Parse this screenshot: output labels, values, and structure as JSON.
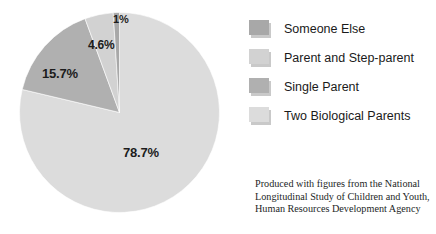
{
  "chart_data": {
    "type": "pie",
    "title": "",
    "labels": [
      "Two Biological Parents",
      "Single Parent",
      "Parent and Step-parent",
      "Someone Else"
    ],
    "values": [
      78.7,
      15.7,
      4.6,
      1
    ],
    "value_labels": [
      "78.7%",
      "15.7%",
      "4.6%",
      "1%"
    ],
    "colors": [
      "#dcdcdc",
      "#b0b0b0",
      "#d2d2d2",
      "#a8a8a8"
    ],
    "start_angle_deg": 0,
    "direction": "clockwise",
    "legend_position": "right",
    "grid": false,
    "units": "percent"
  },
  "legend": {
    "items": [
      {
        "label": "Someone Else",
        "color": "#a8a8a8"
      },
      {
        "label": "Parent and Step-parent",
        "color": "#d2d2d2"
      },
      {
        "label": "Single Parent",
        "color": "#b0b0b0"
      },
      {
        "label": "Two Biological Parents",
        "color": "#dcdcdc"
      }
    ]
  },
  "caption": {
    "line1": "Produced with figures from the National",
    "line2": "Longitudinal Study of Children and Youth,",
    "line3": "Human Resources Development Agency"
  }
}
